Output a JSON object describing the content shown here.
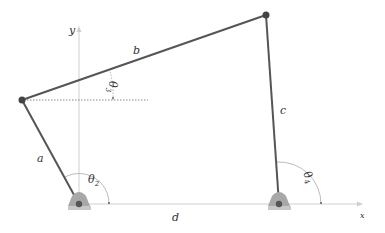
{
  "diagram": {
    "labels": {
      "link_a": "a",
      "link_b": "b",
      "link_c": "c",
      "link_d": "d",
      "theta2": "θ",
      "theta2_sub": "2",
      "theta3": "θ",
      "theta3_sub": "3",
      "theta4": "θ",
      "theta4_sub": "4",
      "y_axis": "y",
      "x_axis": "x"
    },
    "colors": {
      "link": "#555555",
      "joint": "#444444",
      "axis": "#cccccc",
      "ground_fill": "#a8a8a8",
      "ground_base": "#c8c8c8",
      "text": "#333333"
    }
  }
}
